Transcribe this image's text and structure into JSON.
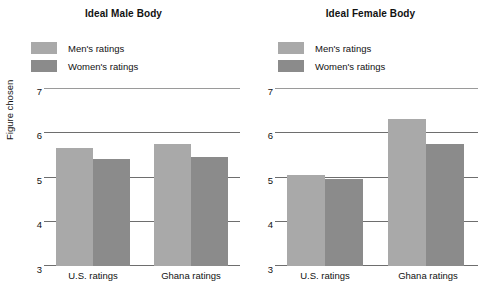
{
  "figure": {
    "ylabel": "Figure chosen",
    "legend": [
      {
        "name": "Men's ratings",
        "color": "#a9a9a9",
        "swatch": "men-swatch"
      },
      {
        "name": "Women's ratings",
        "color": "#8b8b8b",
        "swatch": "women-swatch"
      }
    ],
    "yticks": [
      "7",
      "6",
      "5",
      "4",
      "3"
    ],
    "xticks": [
      "U.S. ratings",
      "Ghana ratings"
    ]
  },
  "chart_data": [
    {
      "type": "bar",
      "title": "Ideal Male Body",
      "xlabel": "",
      "ylabel": "Figure chosen",
      "categories": [
        "U.S. ratings",
        "Ghana ratings"
      ],
      "series": [
        {
          "name": "Men's ratings",
          "color": "#a9a9a9",
          "values": [
            5.65,
            5.75
          ]
        },
        {
          "name": "Women's ratings",
          "color": "#8b8b8b",
          "values": [
            5.4,
            5.45
          ]
        }
      ],
      "ylim": [
        3,
        7
      ],
      "yticks": [
        3,
        4,
        5,
        6,
        7
      ],
      "grid": true,
      "legend_position": "top-left"
    },
    {
      "type": "bar",
      "title": "Ideal Female Body",
      "xlabel": "",
      "ylabel": "Figure chosen",
      "categories": [
        "U.S. ratings",
        "Ghana ratings"
      ],
      "series": [
        {
          "name": "Men's ratings",
          "color": "#a9a9a9",
          "values": [
            5.05,
            6.3
          ]
        },
        {
          "name": "Women's ratings",
          "color": "#8b8b8b",
          "values": [
            4.95,
            5.75
          ]
        }
      ],
      "ylim": [
        3,
        7
      ],
      "yticks": [
        3,
        4,
        5,
        6,
        7
      ],
      "grid": true,
      "legend_position": "top-left"
    }
  ]
}
